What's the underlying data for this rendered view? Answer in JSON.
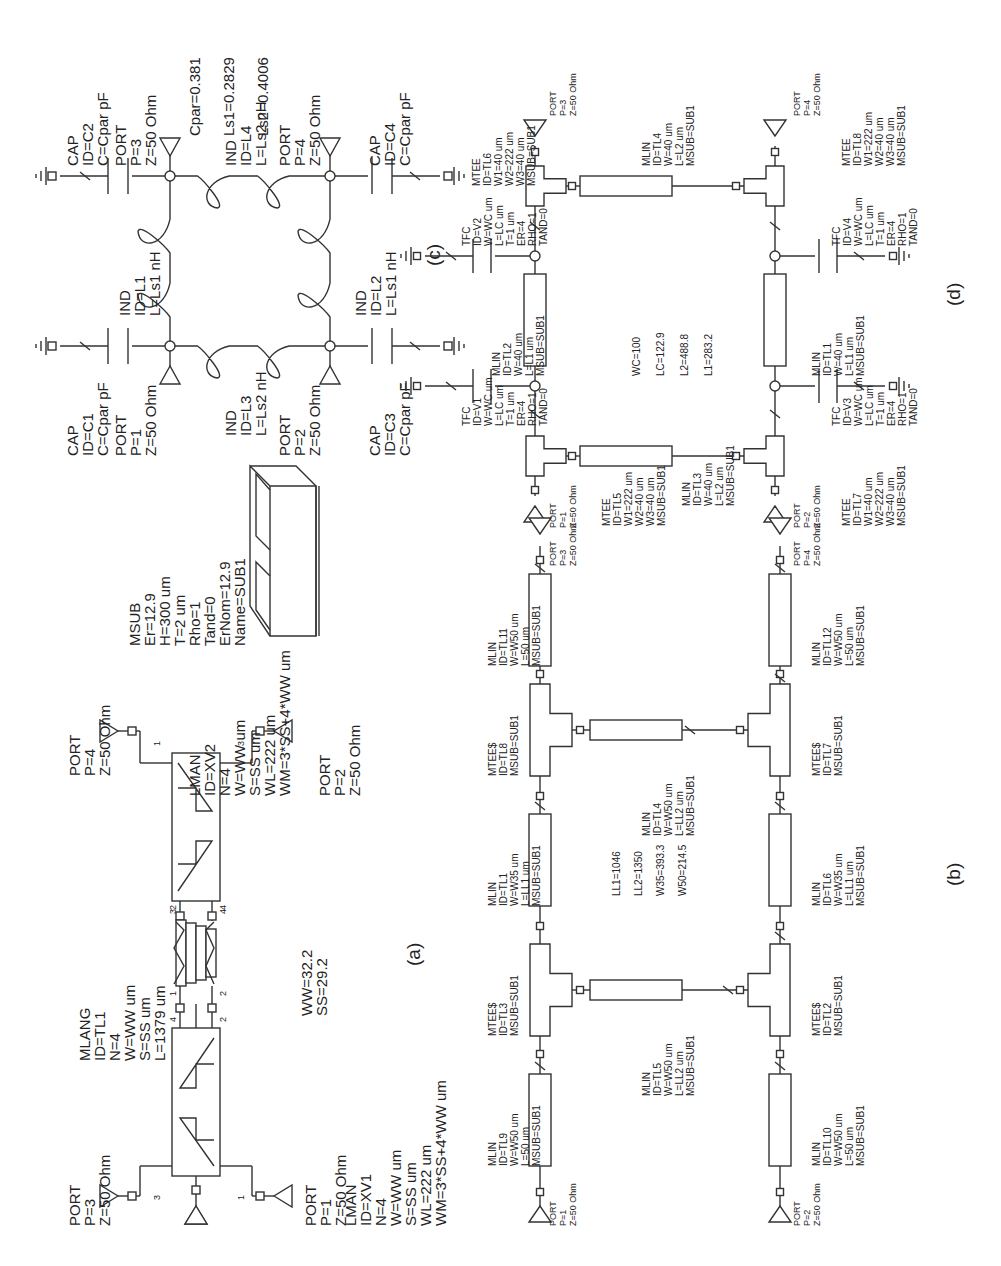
{
  "figure": {
    "type": "circuit-schematic-panels",
    "orientation": "rotated-90-ccw",
    "panels": [
      "a",
      "b",
      "c",
      "d"
    ]
  },
  "panel_a": {
    "label": "(a)",
    "lman1": {
      "lines": [
        "LMAN",
        "ID=XV1",
        "N=4",
        "W=WW um",
        "S=SS um",
        "WL=222 um",
        "WM=3*SS+4*WW um"
      ]
    },
    "lman2": {
      "lines": [
        "LMAN",
        "ID=XV2",
        "N=4",
        "W=WW um",
        "S=SS um",
        "WL=222 um",
        "WM=3*SS+4*WW um"
      ]
    },
    "mlang": {
      "lines": [
        "MLANG",
        "ID=TL1",
        "N=4",
        "W=WW um",
        "S=SS um",
        "L=1379 um"
      ]
    },
    "vars": {
      "lines": [
        "WW=32.2",
        "SS=29.2"
      ]
    },
    "ports": [
      {
        "lines": [
          "PORT",
          "P=3",
          "Z=50 Ohm"
        ]
      },
      {
        "lines": [
          "PORT",
          "P=1",
          "Z=50 Ohm"
        ]
      },
      {
        "lines": [
          "PORT",
          "P=4",
          "Z=50 Ohm"
        ]
      },
      {
        "lines": [
          "PORT",
          "P=2",
          "Z=50 Ohm"
        ]
      }
    ],
    "pin_numbers": {
      "xv1_left": "3",
      "xv1_right": "1",
      "xv1_top_a": "4",
      "xv1_top_b": "2",
      "mlang_1": "1",
      "mlang_2": "2",
      "mlang_3": "3",
      "mlang_4": "4",
      "xv2_bot_a": "2",
      "xv2_bot_b": "4",
      "xv2_left": "1",
      "xv2_right": "3"
    }
  },
  "msub": {
    "lines": [
      "MSUB",
      "Er=12.9",
      "H=300 um",
      "T=2 um",
      "Rho=1",
      "Tand=0",
      "ErNom=12.9",
      "Name=SUB1"
    ]
  },
  "panel_c": {
    "label": "(c)",
    "vars": {
      "lines": [
        "Cpar=0.381",
        "Ls1=0.2829",
        "Ls2=0.4006"
      ]
    },
    "caps": [
      {
        "lines": [
          "CAP",
          "ID=C1",
          "C=Cpar pF"
        ]
      },
      {
        "lines": [
          "CAP",
          "ID=C2",
          "C=Cpar pF"
        ]
      },
      {
        "lines": [
          "CAP",
          "ID=C3",
          "C=Cpar pF"
        ]
      },
      {
        "lines": [
          "CAP",
          "ID=C4",
          "C=Cpar pF"
        ]
      }
    ],
    "inds": [
      {
        "lines": [
          "IND",
          "ID=L1",
          "L=Ls1 nH"
        ]
      },
      {
        "lines": [
          "IND",
          "ID=L2",
          "L=Ls1 nH"
        ]
      },
      {
        "lines": [
          "IND",
          "ID=L3",
          "L=Ls2 nH"
        ]
      },
      {
        "lines": [
          "IND",
          "ID=L4",
          "L=Ls2 nH"
        ]
      }
    ],
    "ports": [
      {
        "lines": [
          "PORT",
          "P=1",
          "Z=50 Ohm"
        ]
      },
      {
        "lines": [
          "PORT",
          "P=2",
          "Z=50 Ohm"
        ]
      },
      {
        "lines": [
          "PORT",
          "P=3",
          "Z=50 Ohm"
        ]
      },
      {
        "lines": [
          "PORT",
          "P=4",
          "Z=50 Ohm"
        ]
      }
    ]
  },
  "panel_d": {
    "label": "(d)",
    "vars": {
      "lines": [
        "WC=100",
        "LC=122.9",
        "L2=488.8",
        "L1=283.2"
      ]
    },
    "mtee": [
      {
        "lines": [
          "MTEE",
          "ID=TL5",
          "W1=222 um",
          "W2=40 um",
          "W3=40 um",
          "MSUB=SUB1"
        ]
      },
      {
        "lines": [
          "MTEE",
          "ID=TL6",
          "W1=40 um",
          "W2=222 um",
          "W3=40 um",
          "MSUB=SUB1"
        ]
      },
      {
        "lines": [
          "MTEE",
          "ID=TL7",
          "W1=40 um",
          "W2=222 um",
          "W3=40 um",
          "MSUB=SUB1"
        ]
      },
      {
        "lines": [
          "MTEE",
          "ID=TL8",
          "W1=222 um",
          "W2=40 um",
          "W3=40 um",
          "MSUB=SUB1"
        ]
      }
    ],
    "tfc": [
      {
        "lines": [
          "TFC",
          "ID=V1",
          "W=WC um",
          "L=LC um",
          "T=1 um",
          "ER=4",
          "RHO=1",
          "TAND=0"
        ]
      },
      {
        "lines": [
          "TFC",
          "ID=V2",
          "W=WC um",
          "L=LC um",
          "T=1 um",
          "ER=4",
          "RHO=1",
          "TAND=0"
        ]
      },
      {
        "lines": [
          "TFC",
          "ID=V3",
          "W=WC um",
          "L=LC um",
          "T=1 um",
          "ER=4",
          "RHO=1",
          "TAND=0"
        ]
      },
      {
        "lines": [
          "TFC",
          "ID=V4",
          "W=WC um",
          "L=LC um",
          "T=1 um",
          "ER=4",
          "RHO=1",
          "TAND=0"
        ]
      }
    ],
    "mlin": [
      {
        "lines": [
          "MLIN",
          "ID=TL1",
          "W=40 um",
          "L=L1 um",
          "MSUB=SUB1"
        ]
      },
      {
        "lines": [
          "MLIN",
          "ID=TL2",
          "W=40 um",
          "L=L1 um",
          "MSUB=SUB1"
        ]
      },
      {
        "lines": [
          "MLIN",
          "ID=TL3",
          "W=40 um",
          "L=L2 um",
          "MSUB=SUB1"
        ]
      },
      {
        "lines": [
          "MLIN",
          "ID=TL4",
          "W=40 um",
          "L=L2 um",
          "MSUB=SUB1"
        ]
      }
    ],
    "ports": [
      {
        "lines": [
          "PORT",
          "P=1",
          "Z=50 Ohm"
        ]
      },
      {
        "lines": [
          "PORT",
          "P=2",
          "Z=50 Ohm"
        ]
      },
      {
        "lines": [
          "PORT",
          "P=3",
          "Z=50 Ohm"
        ]
      },
      {
        "lines": [
          "PORT",
          "P=4",
          "Z=50 Ohm"
        ]
      }
    ]
  },
  "panel_b": {
    "label": "(b)",
    "vars": {
      "lines": [
        "LL1=1046",
        "LL2=1350",
        "W35=393.3",
        "W50=214.5"
      ]
    },
    "mtees": [
      {
        "lines": [
          "MTEE$",
          "ID=TL3",
          "MSUB=SUB1"
        ]
      },
      {
        "lines": [
          "MTEE$",
          "ID=TL8",
          "MSUB=SUB1"
        ]
      },
      {
        "lines": [
          "MTEE$",
          "ID=TL2",
          "MSUB=SUB1"
        ]
      },
      {
        "lines": [
          "MTEE$",
          "ID=TL7",
          "MSUB=SUB1"
        ]
      }
    ],
    "mlin": [
      {
        "lines": [
          "MLIN",
          "ID=TL9",
          "W=W50 um",
          "L=50 um",
          "MSUB=SUB1"
        ]
      },
      {
        "lines": [
          "MLIN",
          "ID=TL1",
          "W=W35 um",
          "L=LL1 um",
          "MSUB=SUB1"
        ]
      },
      {
        "lines": [
          "MLIN",
          "ID=TL11",
          "W=W50 um",
          "L=50 um",
          "MSUB=SUB1"
        ]
      },
      {
        "lines": [
          "MLIN",
          "ID=TL10",
          "W=W50 um",
          "L=50 um",
          "MSUB=SUB1"
        ]
      },
      {
        "lines": [
          "MLIN",
          "ID=TL6",
          "W=W35 um",
          "L=LL1 um",
          "MSUB=SUB1"
        ]
      },
      {
        "lines": [
          "MLIN",
          "ID=TL12",
          "W=W50 um",
          "L=50 um",
          "MSUB=SUB1"
        ]
      },
      {
        "lines": [
          "MLIN",
          "ID=TL5",
          "W=W50 um",
          "L=LL2 um",
          "MSUB=SUB1"
        ]
      },
      {
        "lines": [
          "MLIN",
          "ID=TL4",
          "W=W50 um",
          "L=LL2 um",
          "MSUB=SUB1"
        ]
      }
    ],
    "ports": [
      {
        "lines": [
          "PORT",
          "P=1",
          "Z=50 Ohm"
        ]
      },
      {
        "lines": [
          "PORT",
          "P=2",
          "Z=50 Ohm"
        ]
      },
      {
        "lines": [
          "PORT",
          "P=3",
          "Z=50 Ohm"
        ]
      },
      {
        "lines": [
          "PORT",
          "P=4",
          "Z=50 Ohm"
        ]
      }
    ]
  }
}
